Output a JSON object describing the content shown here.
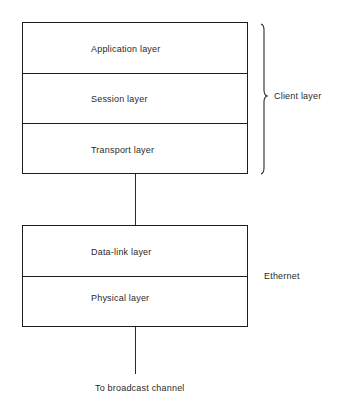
{
  "diagram": {
    "upper_stack": {
      "layers": [
        {
          "label": "Application layer"
        },
        {
          "label": "Session layer"
        },
        {
          "label": "Transport layer"
        }
      ],
      "group_label": "Client layer"
    },
    "lower_stack": {
      "layers": [
        {
          "label": "Data-link layer"
        },
        {
          "label": "Physical layer"
        }
      ],
      "group_label": "Ethernet"
    },
    "bottom_label": "To broadcast channel",
    "colors": {
      "line": "#1e1e1e",
      "text": "#2a2a2a",
      "background": "#ffffff"
    }
  }
}
